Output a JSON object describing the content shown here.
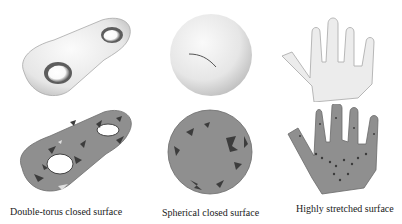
{
  "figure": {
    "panels": [
      {
        "id": "double-torus",
        "caption": "Double-torus closed surface",
        "top_render": "smooth-shaded double-torus surface",
        "bottom_render": "meshed double-torus surface with dark flipped triangles"
      },
      {
        "id": "sphere",
        "caption": "Spherical closed surface",
        "top_render": "smooth-shaded sphere with a cut seam",
        "bottom_render": "meshed sphere with dark flipped triangles"
      },
      {
        "id": "hand",
        "caption": "Highly stretched surface",
        "top_render": "smooth-shaded hand surface",
        "bottom_render": "meshed hand surface with dark flipped triangles"
      }
    ],
    "colors": {
      "smooth_surface": "#eeeeee",
      "mesh_surface": "#8f8f8f",
      "mesh_dark": "#3c3c3c",
      "caption_text": "#1a1a1a"
    }
  }
}
